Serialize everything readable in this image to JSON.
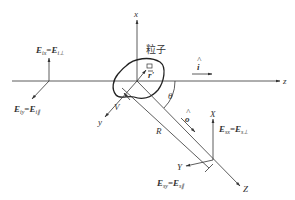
{
  "diagram": {
    "particle_label": "粒子",
    "axes": {
      "particle_frame": {
        "x": "x",
        "y": "y",
        "z": "z"
      },
      "scattered_frame": {
        "x": "X",
        "y": "Y",
        "z": "Z"
      }
    },
    "symbols": {
      "incident_direction": "i",
      "scattered_direction": "o",
      "position_vector": "r'",
      "volume": "V",
      "distance": "R",
      "angle": "θ"
    },
    "incident_field": {
      "x_component": {
        "lhs": "E",
        "lhs_sub": "ix",
        "rhs": "E",
        "rhs_sub": "i⊥"
      },
      "y_component": {
        "lhs": "E",
        "lhs_sub": "iy",
        "rhs": "E",
        "rhs_sub": "i∥"
      }
    },
    "scattered_field": {
      "x_component": {
        "lhs": "E",
        "lhs_sub": "sx",
        "rhs": "E",
        "rhs_sub": "s⊥"
      },
      "y_component": {
        "lhs": "E",
        "lhs_sub": "sy",
        "rhs": "E",
        "rhs_sub": "s∥"
      }
    },
    "equals": "=",
    "hat": "^"
  }
}
